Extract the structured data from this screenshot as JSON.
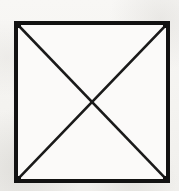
{
  "figure": {
    "title": "Square with both diagonals drawn",
    "medium": "scanned line drawing",
    "canvas": {
      "width": 179,
      "height": 191
    },
    "colors": {
      "page_background": "#f6f5f3",
      "shape_fill": "#fbfaf9",
      "ink": "#121212",
      "ink_secondary": "#1a1a1a"
    },
    "shapes": {
      "square": {
        "name": "outer-square",
        "x": 16,
        "y": 23,
        "width": 152,
        "height": 158,
        "stroke_width": 4,
        "fill": "#fbfaf9",
        "stroke": "#121212"
      },
      "diagonals": [
        {
          "name": "diagonal-top-left-to-bottom-right",
          "x1": 18,
          "y1": 25,
          "x2": 166,
          "y2": 179,
          "stroke_width": 2.6,
          "stroke": "#1a1a1a"
        },
        {
          "name": "diagonal-top-right-to-bottom-left",
          "x1": 166,
          "y1": 25,
          "x2": 18,
          "y2": 179,
          "stroke_width": 2.6,
          "stroke": "#1a1a1a"
        }
      ],
      "intersection": {
        "name": "diagonal-intersection-point",
        "x": 92,
        "y": 102
      }
    },
    "labels": {
      "caption": "",
      "annotations": []
    }
  }
}
